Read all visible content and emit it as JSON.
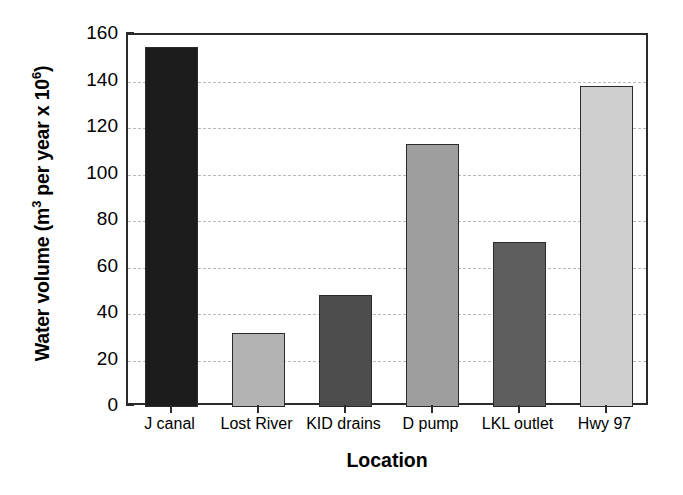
{
  "chart_data": {
    "type": "bar",
    "title": "",
    "xlabel": "Location",
    "ylabel": "Water volume (m3 per year x 106)",
    "ylabel_parts": {
      "lead": "Water volume (m",
      "sup1": "3",
      "mid": " per year x 10",
      "sup2": "6",
      "tail": ")"
    },
    "categories": [
      "J canal",
      "Lost River",
      "KID drains",
      "D pump",
      "LKL outlet",
      "Hwy 97"
    ],
    "values": [
      155,
      32,
      48,
      113,
      71,
      138
    ],
    "bar_colors": [
      "#1c1c1c",
      "#b3b3b3",
      "#4d4d4d",
      "#9e9e9e",
      "#5e5e5e",
      "#cfcfcf"
    ],
    "ylim": [
      0,
      160
    ],
    "yticks": [
      0,
      20,
      40,
      60,
      80,
      100,
      120,
      140,
      160
    ],
    "ytick_labels": [
      "0",
      "20",
      "40",
      "60",
      "80",
      "100",
      "120",
      "140",
      "160"
    ],
    "grid": true,
    "grid_style": "dashed",
    "grid_color": "#b9b9b9",
    "legend": "none",
    "axis_color": "#2b2b2b",
    "background": "#ffffff"
  }
}
